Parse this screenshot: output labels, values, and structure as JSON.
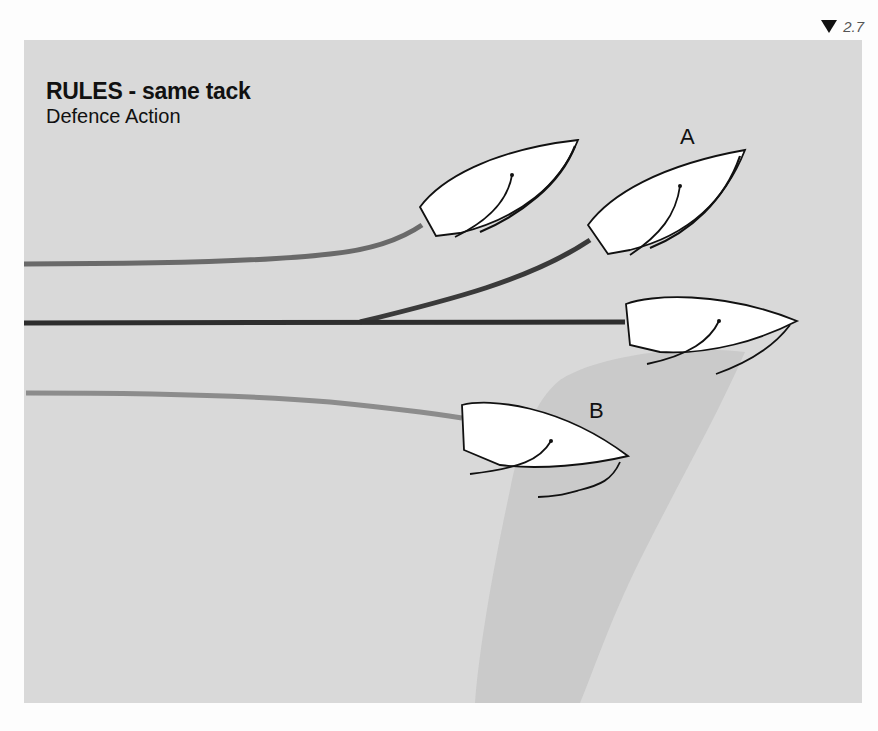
{
  "page": {
    "number": "2.7",
    "marker_icon": "down-triangle-icon"
  },
  "header": {
    "title": "RULES - same tack",
    "subtitle": "Defence Action"
  },
  "diagram": {
    "background_color": "#d9d9d9",
    "wind_shadow_color": "#c9c9c9",
    "boats": [
      {
        "id": "boat-1",
        "label": "",
        "track_color": "#6a6a6a"
      },
      {
        "id": "boat-a",
        "label": "A",
        "track_color": "#3c3c3c"
      },
      {
        "id": "boat-center",
        "label": "",
        "track_color": "#2e2e2e"
      },
      {
        "id": "boat-b",
        "label": "B",
        "track_color": "#8a8a8a"
      }
    ]
  }
}
